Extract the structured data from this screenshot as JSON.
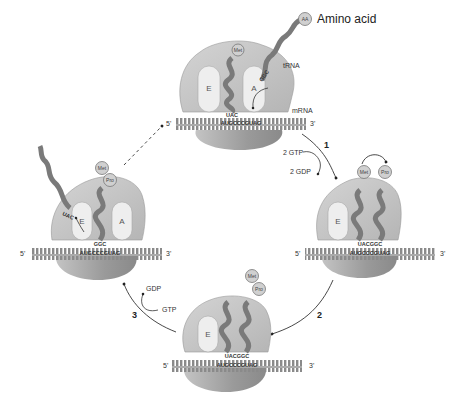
{
  "legend": {
    "amino_acid_label": "Amino acid",
    "amino_acid_icon_text": "AA"
  },
  "colors": {
    "ribosome_light": "#c9c9c9",
    "ribosome_dark": "#8e8e8e",
    "site_fill": "#eeeeee",
    "trna": "#7a7a7a",
    "mrna": "#9a9a9a",
    "arrow": "#333333",
    "background": "#ffffff"
  },
  "panels": {
    "top": {
      "sites": [
        "E",
        "A"
      ],
      "trna_label": "tRNA",
      "mrna_label": "mRNA",
      "p_site_aa": "Met",
      "incoming_anticodon": "GGC",
      "p_anticodon": "UAC",
      "mrna_codons": "AUGCCCGUAG",
      "end5": "5'",
      "end3": "3'"
    },
    "right": {
      "sites": [
        "E"
      ],
      "aa_left": "Met",
      "aa_right": "Pro",
      "anticodons": "UACGGC",
      "mrna_codons": "AUGCCCGUAG",
      "end5": "5'",
      "end3": "3'"
    },
    "bottom": {
      "sites": [
        "E"
      ],
      "aa_top": "Met",
      "aa_bottom": "Pro",
      "anticodons": "UACGGC",
      "mrna_codons": "AUGCCCGUAG",
      "end5": "5'",
      "end3": "3'"
    },
    "left": {
      "sites": [
        "E",
        "A"
      ],
      "aa_top": "Met",
      "aa_bottom": "Pro",
      "exiting_anticodon": "UAC",
      "p_anticodon": "GGC",
      "mrna_codons": "AUGCCCGUAG",
      "end5": "5'",
      "end3": "3'"
    }
  },
  "steps": {
    "step1": {
      "number": "1",
      "input": "2 GTP",
      "output": "2 GDP"
    },
    "step2": {
      "number": "2"
    },
    "step3": {
      "number": "3",
      "input": "GTP",
      "output": "GDP"
    }
  }
}
